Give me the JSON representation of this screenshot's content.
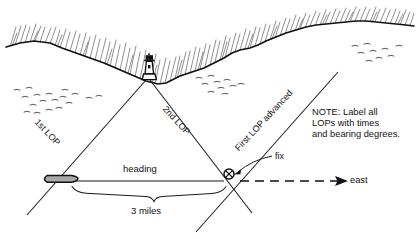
{
  "diagram": {
    "colors": {
      "ink": "#111111",
      "hatch": "#3a3a3a",
      "ship_fill": "#a9a9a9",
      "background": "#ffffff"
    },
    "labels": {
      "lop_first": "1st LOP",
      "lop_second": "2nd LOP",
      "lop_advanced": "First LOP advanced",
      "heading": "heading",
      "distance": "3 miles",
      "fix": "fix",
      "east": "east"
    },
    "note": {
      "line1": "NOTE: Label all",
      "line2": "LOPs with times",
      "line3": "and bearing degrees."
    },
    "features": {
      "lighthouse": "lighthouse-icon",
      "ship": "ship-icon",
      "fix_symbol": "fix-circled-x-icon",
      "coastline": "coastline-hatched",
      "birds_left": "birds-flock-icon",
      "birds_right": "birds-flock-icon",
      "distance_brace": "brace-icon",
      "east_arrow": "east-dashed-arrow"
    }
  }
}
